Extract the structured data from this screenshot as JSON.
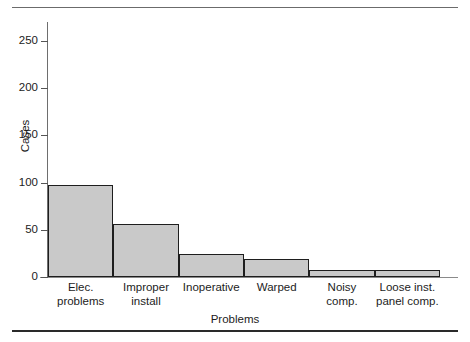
{
  "chart_data": {
    "type": "bar",
    "title": "",
    "xlabel": "Problems",
    "ylabel": "Cases",
    "categories": [
      "Elec. problems",
      "Improper install",
      "Inoperative",
      "Warped",
      "Noisy comp.",
      "Loose inst. panel comp."
    ],
    "category_lines": [
      [
        "Elec.",
        "problems"
      ],
      [
        "Improper",
        "install"
      ],
      [
        "Inoperative"
      ],
      [
        "Warped"
      ],
      [
        "Noisy",
        "comp."
      ],
      [
        "Loose inst.",
        "panel comp."
      ]
    ],
    "values": [
      97,
      56,
      24,
      19,
      7,
      7
    ],
    "ylim": [
      0,
      270
    ],
    "yticks": [
      0,
      50,
      100,
      150,
      200,
      250
    ],
    "ytick_labels": [
      "0",
      "50",
      "100",
      "150",
      "200",
      "250"
    ],
    "grid": false,
    "legend": null,
    "bar_fill_color": "#c9c9c9",
    "bar_edge_color": "#1e1e1e",
    "axis_color": "#6e6e6e"
  }
}
